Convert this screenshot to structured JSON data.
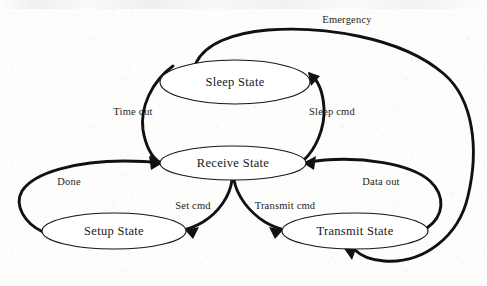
{
  "diagram": {
    "type": "state-transition-diagram",
    "canvas": {
      "width": 487,
      "height": 286
    },
    "stroke_color": "#111115",
    "text_color": "#17171a",
    "background_color": "#fdfdfc",
    "states": [
      {
        "id": "sleep",
        "label": "Sleep State",
        "cx": 235,
        "cy": 82,
        "rx": 75,
        "ry": 22
      },
      {
        "id": "receive",
        "label": "Receive State",
        "cx": 233,
        "cy": 163,
        "rx": 73,
        "ry": 17
      },
      {
        "id": "setup",
        "label": "Setup State",
        "cx": 114,
        "cy": 231,
        "rx": 72,
        "ry": 18
      },
      {
        "id": "transmit",
        "label": "Transmit State",
        "cx": 355,
        "cy": 231,
        "rx": 73,
        "ry": 18
      }
    ],
    "transitions": [
      {
        "id": "timeout",
        "label": "Time out",
        "from": "sleep",
        "to": "receive",
        "label_x": 133,
        "label_y": 113
      },
      {
        "id": "sleep-cmd",
        "label": "Sleep cmd",
        "from": "receive",
        "to": "sleep",
        "label_x": 332,
        "label_y": 113
      },
      {
        "id": "emergency",
        "label": "Emergency",
        "from": "sleep",
        "to": "transmit",
        "label_x": 347,
        "label_y": 21
      },
      {
        "id": "done",
        "label": "Done",
        "from": "setup",
        "to": "receive",
        "label_x": 69,
        "label_y": 183
      },
      {
        "id": "data-out",
        "label": "Data out",
        "from": "transmit",
        "to": "receive",
        "label_x": 381,
        "label_y": 183
      },
      {
        "id": "set-cmd",
        "label": "Set cmd",
        "from": "receive",
        "to": "setup",
        "label_x": 193,
        "label_y": 207
      },
      {
        "id": "transmit-cmd",
        "label": "Transmit cmd",
        "from": "receive",
        "to": "transmit",
        "label_x": 285,
        "label_y": 207
      }
    ]
  }
}
